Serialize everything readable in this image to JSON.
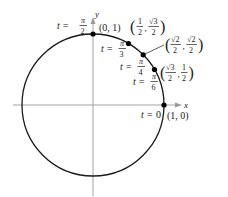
{
  "diagram": {
    "type": "unit-circle",
    "axes": {
      "x_label": "x",
      "y_label": "y"
    },
    "colors": {
      "circle": "#1a1a1a",
      "axis": "#9a9a9a",
      "point": "#000000",
      "text": "#222222"
    },
    "points": [
      {
        "t": "t = 0",
        "t_eq": "t =",
        "t_num": "0",
        "coord": "(1, 0)"
      },
      {
        "t": "t = π/6",
        "t_eq": "t =",
        "t_top": "π",
        "t_bot": "6",
        "x_top": "√3",
        "x_bot": "2",
        "y_top": "1",
        "y_bot": "2"
      },
      {
        "t": "t = π/4",
        "t_eq": "t =",
        "t_top": "π",
        "t_bot": "4",
        "x_top": "√2",
        "x_bot": "2",
        "y_top": "√2",
        "y_bot": "2"
      },
      {
        "t": "t = π/3",
        "t_eq": "t =",
        "t_top": "π",
        "t_bot": "3",
        "x_top": "1",
        "x_bot": "2",
        "y_top": "√3",
        "y_bot": "2"
      },
      {
        "t": "t = π/2",
        "t_eq": "t =",
        "t_top": "π",
        "t_bot": "2",
        "coord": "(0, 1)"
      }
    ]
  }
}
